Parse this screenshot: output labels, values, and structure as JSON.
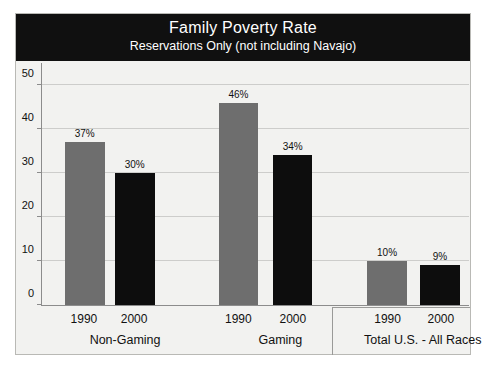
{
  "chart_data": {
    "type": "bar",
    "title": "Family Poverty Rate",
    "subtitle": "Reservations Only (not including Navajo)",
    "xlabel": "",
    "ylabel": "",
    "ylim": [
      0,
      55
    ],
    "yticks": [
      0,
      10,
      20,
      30,
      40,
      50
    ],
    "grid": true,
    "legend_position": "none",
    "categories": [
      "Non-Gaming",
      "Gaming",
      "Total U.S. - All Races"
    ],
    "series": [
      {
        "name": "1990",
        "color": "#6e6e6e",
        "values": [
          37,
          46,
          10
        ],
        "labels": [
          "37%",
          "46%",
          "10%"
        ]
      },
      {
        "name": "2000",
        "color": "#0d0d0d",
        "values": [
          30,
          34,
          9
        ],
        "labels": [
          "30%",
          "34%",
          "9%"
        ]
      }
    ],
    "groups": [
      {
        "label": "Non-Gaming",
        "center_pct": 19.6,
        "bars": [
          {
            "series": "1990",
            "value": 37,
            "label": "37%",
            "color": "gray",
            "left_pct": 5.4,
            "width_pct": 9.3,
            "center_pct": 10.0
          },
          {
            "series": "2000",
            "value": 30,
            "label": "30%",
            "color": "black",
            "left_pct": 17.1,
            "width_pct": 9.3,
            "center_pct": 21.7
          }
        ]
      },
      {
        "label": "Gaming",
        "center_pct": 55.8,
        "bars": [
          {
            "series": "1990",
            "value": 46,
            "label": "46%",
            "color": "gray",
            "left_pct": 41.4,
            "width_pct": 9.3,
            "center_pct": 46.0
          },
          {
            "series": "2000",
            "value": 34,
            "label": "34%",
            "color": "black",
            "left_pct": 54.0,
            "width_pct": 9.3,
            "center_pct": 58.7
          }
        ]
      },
      {
        "label": "Total U.S. - All Races",
        "center_pct": 89.0,
        "bars": [
          {
            "series": "1990",
            "value": 10,
            "label": "10%",
            "color": "gray",
            "left_pct": 76.2,
            "width_pct": 9.3,
            "center_pct": 80.8
          },
          {
            "series": "2000",
            "value": 9,
            "label": "9%",
            "color": "black",
            "left_pct": 88.6,
            "width_pct": 9.3,
            "center_pct": 93.2
          }
        ]
      }
    ]
  }
}
